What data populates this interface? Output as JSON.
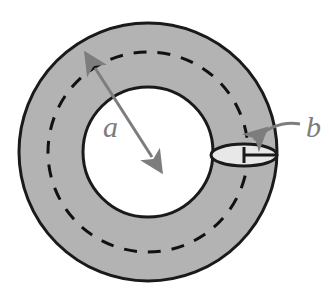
{
  "figure": {
    "name": "torus-cross-section-diagram",
    "title": "",
    "background_color": "#ffffff",
    "width": 329,
    "height": 307
  },
  "colors": {
    "annulus_fill": "#b3b3b3",
    "hole_fill": "#ffffff",
    "outline": "#1a1a1a",
    "dashed_centerline": "#111111",
    "label_gray": "#7d7d7d",
    "arrow_gray": "#7d7d7d",
    "tube_face_fill": "#e8e8e8"
  },
  "labels": {
    "major_radius": "a",
    "minor_radius": "b"
  },
  "shapes": {
    "outer_circle": {
      "name": "torus-outer-edge",
      "cx": 148,
      "cy": 152,
      "r": 129,
      "stroke_width": 3
    },
    "inner_circle": {
      "name": "torus-inner-hole",
      "cx": 148,
      "cy": 152,
      "r": 65,
      "stroke_width": 3
    },
    "dashed_circle": {
      "name": "torus-tube-centerline",
      "cx": 148,
      "cy": 152,
      "r": 100,
      "stroke_width": 3,
      "dash_pattern": "13 11"
    },
    "tube_cross_section": {
      "name": "tube-cross-section-ellipse",
      "cx": 244,
      "cy": 155,
      "rx": 33,
      "ry": 11,
      "stroke_width": 3
    }
  },
  "annotations": {
    "major_radius_arrow": {
      "name": "major-radius-arrow",
      "from_x": 95,
      "from_y": 68,
      "to_x": 152,
      "to_y": 157,
      "double_headed": true,
      "stroke_width": 3,
      "label_x": 103,
      "label_y": 137,
      "label_size": 30
    },
    "minor_radius_dimension": {
      "name": "minor-radius-dimension-line",
      "from_x": 244,
      "from_y": 155,
      "to_x": 276,
      "to_y": 155,
      "tick_height": 16,
      "stroke_width": 3
    },
    "minor_radius_leader": {
      "name": "minor-radius-leader-arrow",
      "path": "M 300 124 C 283 121, 268 127, 254 140",
      "stroke_width": 3,
      "label_x": 306,
      "label_y": 137,
      "label_size": 30
    }
  },
  "chart_data": {
    "type": "diagram",
    "description_items": [
      {
        "symbol": "a",
        "meaning": "major radius (center of torus to center of tube)"
      },
      {
        "symbol": "b",
        "meaning": "minor radius (radius of the tube cross-section)"
      }
    ],
    "measured_geometry": {
      "outer_radius_px": 129,
      "hole_radius_px": 65,
      "centerline_radius_px": 100,
      "tube_radius_px": 33
    }
  }
}
